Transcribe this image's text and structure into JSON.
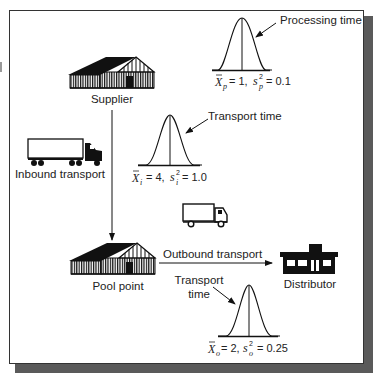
{
  "diagram": {
    "nodes": {
      "supplier": {
        "label": "Supplier",
        "icon": "warehouse-icon"
      },
      "pool_point": {
        "label": "Pool point",
        "icon": "warehouse-icon"
      },
      "distributor": {
        "label": "Distributor",
        "icon": "store-icon"
      }
    },
    "links": {
      "inbound": {
        "label": "Inbound transport",
        "icon": "semi-truck-icon"
      },
      "outbound": {
        "label": "Outbound transport",
        "icon": "box-truck-icon"
      }
    },
    "distributions": {
      "processing": {
        "label": "Processing time",
        "mean_symbol": "X",
        "mean_sub": "p",
        "mean_value": "= 1,",
        "var_symbol": "s",
        "var_sup": "2",
        "var_sub": "p",
        "var_value": "= 0.1"
      },
      "inbound_transport": {
        "label": "Transport time",
        "mean_symbol": "X",
        "mean_sub": "i",
        "mean_value": "= 4,",
        "var_symbol": "s",
        "var_sup": "2",
        "var_sub": "i",
        "var_value": "= 1.0"
      },
      "outbound_transport": {
        "label_line1": "Transport",
        "label_line2": "time",
        "mean_symbol": "X",
        "mean_sub": "o",
        "mean_value": "= 2,",
        "var_symbol": "s",
        "var_sup": "2",
        "var_sub": "o",
        "var_value": "= 0.25"
      }
    },
    "colors": {
      "ink": "#111111",
      "frame": "#333333",
      "shadow": "#5a5a5a",
      "background": "#ffffff"
    }
  }
}
